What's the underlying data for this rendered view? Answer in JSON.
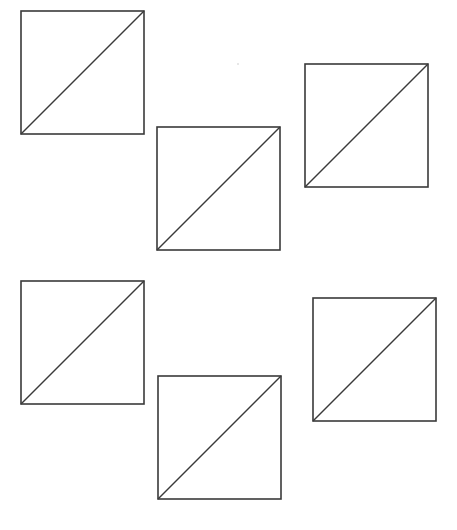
{
  "canvas": {
    "width": 457,
    "height": 530,
    "background": "#ffffff",
    "stroke_color": "#3a3a3a"
  },
  "figures": [
    {
      "id": "square-1",
      "x": 21,
      "y": 11,
      "size": 123,
      "diagonal": "bottom-left-to-top-right"
    },
    {
      "id": "square-2",
      "x": 157,
      "y": 127,
      "size": 123,
      "diagonal": "bottom-left-to-top-right"
    },
    {
      "id": "square-3",
      "x": 305,
      "y": 64,
      "size": 123,
      "diagonal": "bottom-left-to-top-right"
    },
    {
      "id": "square-4",
      "x": 21,
      "y": 281,
      "size": 123,
      "diagonal": "bottom-left-to-top-right"
    },
    {
      "id": "square-5",
      "x": 158,
      "y": 376,
      "size": 123,
      "diagonal": "bottom-left-to-top-right"
    },
    {
      "id": "square-6",
      "x": 313,
      "y": 298,
      "size": 123,
      "diagonal": "bottom-left-to-top-right"
    }
  ]
}
